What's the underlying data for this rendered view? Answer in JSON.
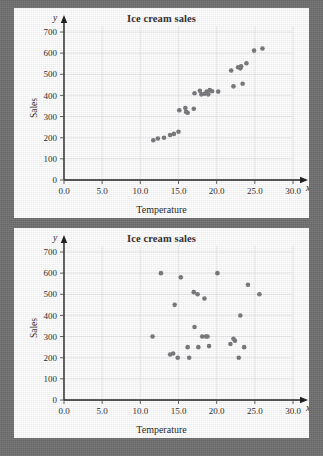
{
  "page": {
    "background_color": "#6f6f6f",
    "panel_color": "#ffffff"
  },
  "charts": [
    {
      "id": "chart-top",
      "title": "Ice cream sales",
      "xlabel": "Temperature",
      "ylabel": "Sales",
      "x_var": "x",
      "y_var": "y"
    },
    {
      "id": "chart-bottom",
      "title": "Ice cream sales",
      "xlabel": "Temperature",
      "ylabel": "Sales",
      "x_var": "x",
      "y_var": "y"
    }
  ],
  "chart_data": [
    {
      "type": "scatter",
      "title": "Ice cream sales",
      "xlabel": "Temperature",
      "ylabel": "Sales",
      "xlim": [
        0,
        30
      ],
      "ylim": [
        0,
        700
      ],
      "xticks": [
        "0.0",
        "5.0",
        "10.0",
        "15.0",
        "20.0",
        "25.0",
        "30.0"
      ],
      "xtick_values": [
        0,
        5,
        10,
        15,
        20,
        25,
        30
      ],
      "yticks": [
        "0",
        "100",
        "200",
        "300",
        "400",
        "500",
        "600",
        "700"
      ],
      "ytick_values": [
        0,
        100,
        200,
        300,
        400,
        500,
        600,
        700
      ],
      "grid": true,
      "legend": "none",
      "marker_color": "#77777b",
      "relationship": "positive linear correlation",
      "points": [
        [
          11.7,
          188
        ],
        [
          12.3,
          196
        ],
        [
          13.1,
          200
        ],
        [
          13.9,
          213
        ],
        [
          14.4,
          218
        ],
        [
          15.0,
          228
        ],
        [
          15.1,
          330
        ],
        [
          15.9,
          340
        ],
        [
          16.0,
          322
        ],
        [
          16.2,
          318
        ],
        [
          17.0,
          337
        ],
        [
          17.1,
          410
        ],
        [
          17.8,
          422
        ],
        [
          18.0,
          405
        ],
        [
          18.4,
          408
        ],
        [
          18.7,
          418
        ],
        [
          18.9,
          405
        ],
        [
          19.1,
          425
        ],
        [
          19.4,
          420
        ],
        [
          20.2,
          418
        ],
        [
          21.9,
          518
        ],
        [
          22.2,
          443
        ],
        [
          22.8,
          533
        ],
        [
          23.1,
          528
        ],
        [
          23.2,
          538
        ],
        [
          23.4,
          455
        ],
        [
          23.9,
          552
        ],
        [
          24.9,
          612
        ],
        [
          26.0,
          622
        ]
      ]
    },
    {
      "type": "scatter",
      "title": "Ice cream sales",
      "xlabel": "Temperature",
      "ylabel": "Sales",
      "xlim": [
        0,
        30
      ],
      "ylim": [
        0,
        700
      ],
      "xticks": [
        "0.0",
        "5.0",
        "10.0",
        "15.0",
        "20.0",
        "25.0",
        "30.0"
      ],
      "xtick_values": [
        0,
        5,
        10,
        15,
        20,
        25,
        30
      ],
      "yticks": [
        "0",
        "100",
        "200",
        "300",
        "400",
        "500",
        "600",
        "700"
      ],
      "ytick_values": [
        0,
        100,
        200,
        300,
        400,
        500,
        600,
        700
      ],
      "grid": true,
      "legend": "none",
      "marker_color": "#77777b",
      "relationship": "no correlation",
      "points": [
        [
          11.6,
          300
        ],
        [
          12.7,
          600
        ],
        [
          13.9,
          215
        ],
        [
          14.3,
          220
        ],
        [
          14.5,
          450
        ],
        [
          14.9,
          200
        ],
        [
          15.3,
          580
        ],
        [
          16.2,
          250
        ],
        [
          16.4,
          200
        ],
        [
          17.0,
          510
        ],
        [
          17.1,
          345
        ],
        [
          17.5,
          500
        ],
        [
          17.6,
          250
        ],
        [
          18.1,
          300
        ],
        [
          18.4,
          480
        ],
        [
          18.6,
          300
        ],
        [
          18.8,
          300
        ],
        [
          19.0,
          255
        ],
        [
          20.1,
          600
        ],
        [
          21.8,
          265
        ],
        [
          22.2,
          290
        ],
        [
          22.4,
          280
        ],
        [
          22.9,
          200
        ],
        [
          23.1,
          400
        ],
        [
          23.6,
          250
        ],
        [
          24.1,
          545
        ],
        [
          25.6,
          500
        ]
      ]
    }
  ]
}
